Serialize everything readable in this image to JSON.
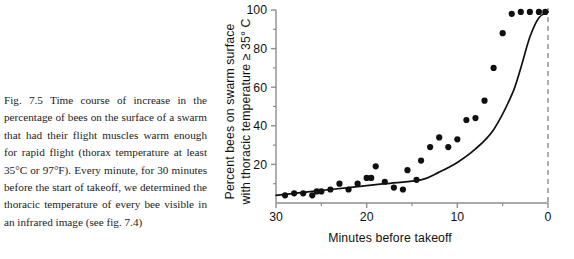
{
  "caption": {
    "text": "Fig. 7.5 Time course of increase in the percentage of bees on the surface of a swarm that had their flight muscles warm enough for rapid flight (thorax temperature at least 35°C or 97°F). Every minute, for 30 minutes before the start of takeoff, we determined the thoracic temperature of every bee visible in an infrared image (see fig. 7.4)"
  },
  "colors": {
    "axis": "#8d8d8d",
    "point": "#101010",
    "curve": "#101010",
    "dashed_line": "#9a9a9a",
    "text": "#111111",
    "background": "#ffffff"
  },
  "chart_data": {
    "type": "scatter",
    "title": "",
    "xlabel": "Minutes before takeoff",
    "ylabel": "Percent bees on swarm surface with thoracic temperature ≥ 35° C",
    "ylabel_line1": "Percent bees on swarm surface",
    "ylabel_line2": "with thoracic temperature ≥ 35° C",
    "xlim": [
      30,
      0
    ],
    "ylim": [
      0,
      100
    ],
    "x_reversed": true,
    "xticks": [
      30,
      20,
      10,
      0
    ],
    "xtick_labels": [
      "30",
      "20",
      "10",
      "0"
    ],
    "xminor_ticks": [
      25,
      15,
      5
    ],
    "yticks": [
      20,
      40,
      60,
      80,
      100
    ],
    "ytick_labels": [
      "20",
      "40",
      "60",
      "80",
      "100"
    ],
    "yminor_ticks": [
      10,
      30,
      50,
      70,
      90
    ],
    "grid": false,
    "legend": false,
    "annotations": [
      {
        "name": "takeoff-line",
        "type": "vertical-dashed-line",
        "x": 0,
        "label": ""
      }
    ],
    "series": [
      {
        "name": "Observed percent of warm bees",
        "marker": "filled-circle",
        "x": [
          29,
          28,
          27,
          26,
          25.5,
          25,
          24,
          23,
          22,
          21,
          20,
          19.5,
          19,
          18,
          17,
          16,
          15.5,
          14.5,
          14,
          13,
          12,
          11,
          10,
          9,
          8,
          7,
          6,
          5,
          4,
          3,
          2,
          1,
          0.3
        ],
        "y": [
          4,
          5,
          5,
          4,
          6,
          6,
          7,
          10,
          7,
          10,
          13,
          13,
          19,
          11,
          8,
          7,
          17,
          12,
          22,
          29,
          34,
          29,
          33,
          43,
          44,
          53,
          70,
          88,
          98,
          99,
          99,
          99,
          99
        ]
      },
      {
        "name": "Fitted trend curve",
        "marker": "line",
        "x": [
          30,
          26,
          22,
          18,
          14,
          12,
          10,
          8,
          6,
          4,
          3,
          2,
          1,
          0
        ],
        "y": [
          4,
          6,
          8,
          10,
          12,
          16,
          21,
          28,
          38,
          56,
          70,
          86,
          96,
          99
        ]
      }
    ]
  }
}
